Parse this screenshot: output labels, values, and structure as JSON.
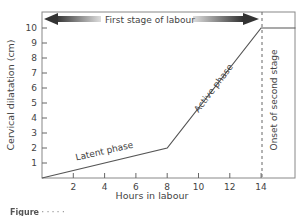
{
  "chart_data": {
    "type": "line",
    "title": "",
    "xlabel": "Hours in labour",
    "ylabel": "Cervical dilatation (cm)",
    "xlim": [
      0,
      16.2
    ],
    "ylim": [
      0,
      10.8
    ],
    "x_ticks": [
      2,
      4,
      6,
      8,
      10,
      12,
      14
    ],
    "y_ticks": [
      1,
      2,
      3,
      4,
      5,
      6,
      7,
      8,
      9,
      10
    ],
    "grid": false,
    "legend": null,
    "series": [
      {
        "name": "Cervical dilatation",
        "x": [
          0,
          8,
          14,
          16.2
        ],
        "y": [
          0,
          2,
          10,
          10
        ]
      }
    ],
    "annotations": [
      {
        "text": "Latent phase",
        "x": 4,
        "y": 1,
        "rotation": -13
      },
      {
        "text": "Active phase",
        "x": 11,
        "y": 6,
        "rotation": -53
      },
      {
        "text": "Onset of second stage",
        "x": 14.6,
        "y": 5,
        "rotation": -90
      },
      {
        "text": "First stage of labour",
        "type": "double-arrow",
        "x_from": 0,
        "x_to": 14,
        "y": 10.4
      },
      {
        "type": "dashed-vline",
        "x": 14
      }
    ]
  },
  "labels": {
    "xlabel": "Hours in labour",
    "ylabel": "Cervical dilatation (cm)",
    "latent": "Latent phase",
    "active": "Active phase",
    "onset": "Onset of second stage",
    "first_stage": "First stage of labour",
    "x_ticks": [
      "2",
      "4",
      "6",
      "8",
      "10",
      "12",
      "14"
    ],
    "y_ticks": [
      "1",
      "2",
      "3",
      "4",
      "5",
      "6",
      "7",
      "8",
      "9",
      "10"
    ]
  },
  "caption": {
    "prefix": "Figure",
    "text": "· · · · ·"
  }
}
